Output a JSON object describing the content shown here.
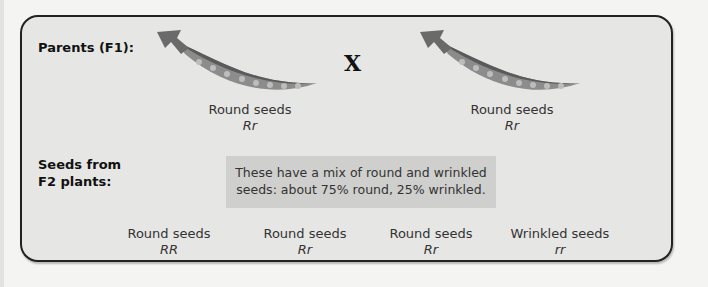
{
  "diagram": {
    "parents_label": "Parents (F1):",
    "cross_symbol": "X",
    "parents": [
      {
        "phenotype": "Round seeds",
        "genotype": "Rr"
      },
      {
        "phenotype": "Round seeds",
        "genotype": "Rr"
      }
    ],
    "offspring_label_line1": "Seeds from",
    "offspring_label_line2": "F2 plants:",
    "note_line1": "These have a mix of round and wrinkled",
    "note_line2": "seeds: about 75% round, 25% wrinkled.",
    "offspring": [
      {
        "phenotype": "Round seeds",
        "genotype": "RR"
      },
      {
        "phenotype": "Round seeds",
        "genotype": "Rr"
      },
      {
        "phenotype": "Round seeds",
        "genotype": "Rr"
      },
      {
        "phenotype": "Wrinkled seeds",
        "genotype": "rr"
      }
    ],
    "colors": {
      "panel_bg": "#e6e6e4",
      "panel_border": "#222222",
      "note_bg": "#cfcfcd",
      "pod": "#8c8c8c",
      "pod_dark": "#5a5a5a"
    }
  }
}
